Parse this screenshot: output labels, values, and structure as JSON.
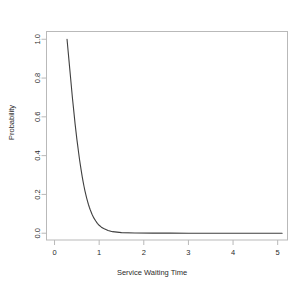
{
  "chart_data": {
    "type": "line",
    "title": "Exponential Distribution for Service Process (M/M/1)",
    "xlabel": "Service Waiting Time",
    "ylabel": "Probability",
    "xlim": [
      -0.18,
      5.22
    ],
    "ylim": [
      -0.035,
      1.04
    ],
    "xticks": [
      0,
      1,
      2,
      3,
      4,
      5
    ],
    "xticklabels": [
      "0",
      "1",
      "2",
      "3",
      "4",
      "5"
    ],
    "yticks": [
      0.0,
      0.2,
      0.4,
      0.6,
      0.8,
      1.0
    ],
    "yticklabels": [
      "0.0",
      "0.2",
      "0.4",
      "0.6",
      "0.8",
      "1.0"
    ],
    "grid": false,
    "legend": false,
    "line_color": "#3f3f3f",
    "frame_color": "#b9b9b9",
    "background": "#ffffff",
    "series": [
      {
        "name": "Exponential density",
        "x": [
          0.28,
          0.3,
          0.32,
          0.34,
          0.36,
          0.38,
          0.4,
          0.42,
          0.44,
          0.46,
          0.48,
          0.5,
          0.52,
          0.54,
          0.56,
          0.58,
          0.6,
          0.62,
          0.64,
          0.66,
          0.68,
          0.7,
          0.72,
          0.74,
          0.76,
          0.78,
          0.8,
          0.84,
          0.88,
          0.92,
          0.96,
          1.0,
          1.05,
          1.1,
          1.2,
          1.3,
          1.5,
          1.8,
          2.2,
          2.6,
          3.0,
          3.5,
          4.0,
          4.5,
          5.0,
          5.1
        ],
        "y": [
          1.0,
          0.95,
          0.9,
          0.85,
          0.8,
          0.75,
          0.7,
          0.655,
          0.61,
          0.565,
          0.525,
          0.485,
          0.45,
          0.415,
          0.38,
          0.35,
          0.32,
          0.292,
          0.266,
          0.242,
          0.22,
          0.2,
          0.181,
          0.164,
          0.148,
          0.134,
          0.121,
          0.098,
          0.079,
          0.064,
          0.051,
          0.041,
          0.031,
          0.024,
          0.014,
          0.008,
          0.003,
          0.001,
          0.0005,
          0.0002,
          0.0001,
          0.0,
          0.0,
          0.0,
          0.0,
          0.0
        ]
      }
    ]
  }
}
